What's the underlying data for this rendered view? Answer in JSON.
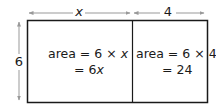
{
  "diagram": {
    "type": "area-model-rectangle",
    "dimensions": {
      "width_left": "x",
      "width_right": "4",
      "height": "6"
    },
    "left_region": {
      "line1_prefix": "area = 6 × ",
      "line1_var": "x",
      "line2_prefix": "= 6",
      "line2_var": "x"
    },
    "right_region": {
      "line1": "area = 6 × 4",
      "line2": "= 24"
    },
    "colors": {
      "outline": "#1a1a1a",
      "arrow": "#999999",
      "text": "#1a1a1a"
    }
  }
}
